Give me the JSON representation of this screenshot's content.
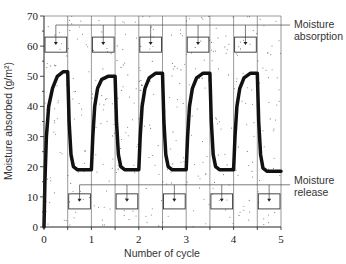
{
  "chart_data": {
    "type": "line",
    "title": "",
    "xlabel": "Number of cycle",
    "ylabel": "Moisture absorbed (g/m²)",
    "xlim": [
      0,
      5
    ],
    "ylim": [
      0,
      70
    ],
    "x_ticks": [
      0,
      1,
      2,
      3,
      4,
      5
    ],
    "y_ticks": [
      0,
      10,
      20,
      30,
      40,
      50,
      60,
      70
    ],
    "grid": {
      "vertical_lines_every": 0.5,
      "horizontal": false
    },
    "background": "stippled (dotted) shading in absorption/release regions",
    "series": [
      {
        "name": "Moisture absorbed",
        "color": "#111111",
        "line_width": 3.5,
        "points": [
          [
            0.0,
            0
          ],
          [
            0.02,
            15
          ],
          [
            0.05,
            30
          ],
          [
            0.1,
            40
          ],
          [
            0.18,
            46
          ],
          [
            0.28,
            50
          ],
          [
            0.4,
            51.5
          ],
          [
            0.5,
            51.5
          ],
          [
            0.53,
            35
          ],
          [
            0.57,
            24
          ],
          [
            0.62,
            20
          ],
          [
            0.7,
            19
          ],
          [
            1.0,
            19
          ],
          [
            1.03,
            30
          ],
          [
            1.07,
            40
          ],
          [
            1.13,
            46
          ],
          [
            1.22,
            49
          ],
          [
            1.35,
            50
          ],
          [
            1.5,
            50
          ],
          [
            1.53,
            35
          ],
          [
            1.57,
            24
          ],
          [
            1.62,
            20
          ],
          [
            1.7,
            19
          ],
          [
            2.0,
            19
          ],
          [
            2.03,
            30
          ],
          [
            2.07,
            40
          ],
          [
            2.13,
            46
          ],
          [
            2.22,
            49.5
          ],
          [
            2.35,
            51
          ],
          [
            2.5,
            51
          ],
          [
            2.53,
            35
          ],
          [
            2.57,
            24
          ],
          [
            2.62,
            20
          ],
          [
            2.7,
            19
          ],
          [
            3.0,
            19
          ],
          [
            3.03,
            30
          ],
          [
            3.07,
            40
          ],
          [
            3.13,
            46
          ],
          [
            3.22,
            49.5
          ],
          [
            3.35,
            51
          ],
          [
            3.5,
            51
          ],
          [
            3.53,
            35
          ],
          [
            3.57,
            24
          ],
          [
            3.62,
            20
          ],
          [
            3.7,
            19
          ],
          [
            4.0,
            19
          ],
          [
            4.03,
            30
          ],
          [
            4.07,
            40
          ],
          [
            4.13,
            46
          ],
          [
            4.22,
            49.5
          ],
          [
            4.35,
            51
          ],
          [
            4.5,
            51
          ],
          [
            4.53,
            35
          ],
          [
            4.57,
            24
          ],
          [
            4.62,
            19.5
          ],
          [
            4.7,
            18.5
          ],
          [
            5.0,
            18.5
          ]
        ]
      }
    ],
    "annotations": [
      {
        "text": "Moisture absorption",
        "line_y": 67,
        "boxes_y": [
          58,
          63
        ],
        "box_x_ranges": [
          [
            0.0,
            0.5
          ],
          [
            1.0,
            1.5
          ],
          [
            2.0,
            2.5
          ],
          [
            3.0,
            3.5
          ],
          [
            4.0,
            4.5
          ]
        ]
      },
      {
        "text": "Moisture release",
        "line_y": 14,
        "boxes_y": [
          6,
          11
        ],
        "box_x_ranges": [
          [
            0.5,
            1.0
          ],
          [
            1.5,
            2.0
          ],
          [
            2.5,
            3.0
          ],
          [
            3.5,
            4.0
          ],
          [
            4.5,
            5.0
          ]
        ]
      }
    ],
    "legend": null
  },
  "labels": {
    "absorption_line1": "Moisture",
    "absorption_line2": "absorption",
    "release_line1": "Moisture",
    "release_line2": "release",
    "xlabel": "Number of cycle",
    "ylabel": "Moisture absorbed (g/m²)"
  }
}
